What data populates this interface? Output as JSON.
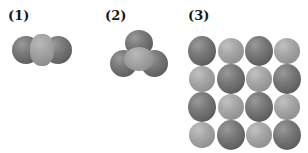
{
  "figure": {
    "panels": [
      {
        "label": "(1)",
        "description": "linear triatomic molecule space-filling model"
      },
      {
        "label": "(2)",
        "description": "trigonal planar molecule space-filling model"
      },
      {
        "label": "(3)",
        "description": "4x4 ionic lattice layer of alternating spheres"
      }
    ],
    "lattice_pattern": [
      [
        "dark",
        "light",
        "dark",
        "light"
      ],
      [
        "light",
        "dark",
        "light",
        "dark"
      ],
      [
        "dark",
        "light",
        "dark",
        "light"
      ],
      [
        "light",
        "dark",
        "light",
        "dark"
      ]
    ],
    "colors": {
      "dark_sphere": "#6a6a6a",
      "light_sphere": "#a5a5a5",
      "background": "#ffffff"
    }
  }
}
